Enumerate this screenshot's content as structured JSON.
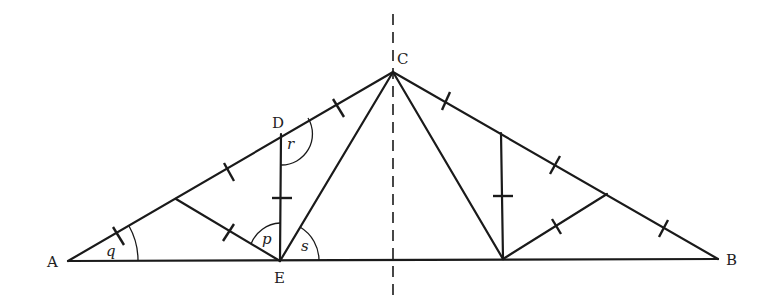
{
  "figure": {
    "type": "geometry-diagram",
    "points": {
      "A": {
        "label": "A",
        "x": 68,
        "y": 261
      },
      "B": {
        "label": "B",
        "x": 718,
        "y": 259
      },
      "C": {
        "label": "C",
        "x": 393,
        "y": 72
      },
      "D": {
        "label": "D",
        "x": 281,
        "y": 134
      },
      "E": {
        "label": "E",
        "x": 280,
        "y": 261
      }
    },
    "angles": {
      "q": {
        "label": "q",
        "at": "A"
      },
      "p": {
        "label": "p",
        "at": "E"
      },
      "r": {
        "label": "r",
        "at": "D"
      },
      "s": {
        "label": "s",
        "at": "E"
      }
    },
    "symmetry_axis": "vertical dashed line through C"
  }
}
